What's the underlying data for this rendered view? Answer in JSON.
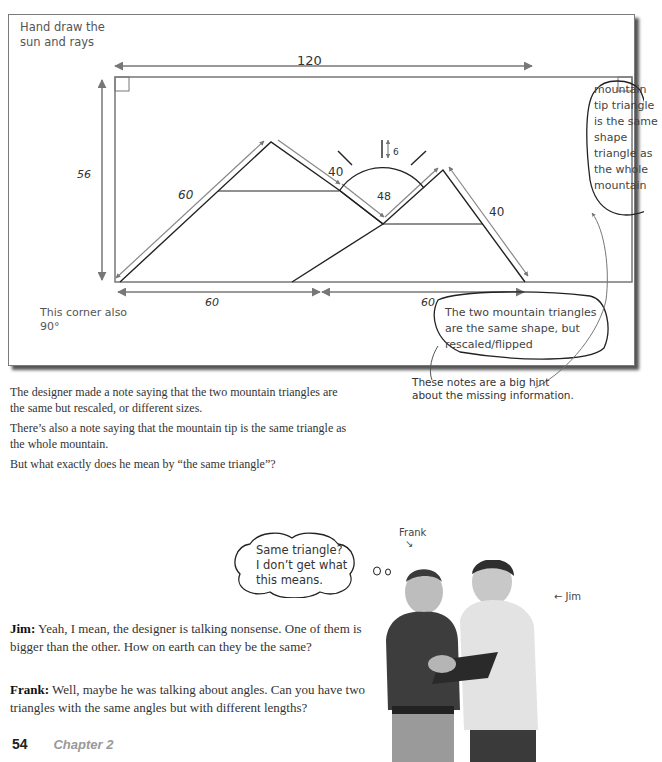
{
  "diagram": {
    "note_top_left": [
      "Hand draw the",
      "sun and rays"
    ],
    "width_label": "120",
    "height_label": "56",
    "left_slope_label": "60",
    "left_inner_slope_label": "40",
    "sun_radius_label": "48",
    "ray_length_label": "6",
    "right_slope_label": "40",
    "bottom_left_label": "60",
    "bottom_right_label": "60",
    "note_bottom_left": [
      "This corner also",
      "90°"
    ],
    "note_right": "mountain tip triangle is the same shape triangle as the whole mountain",
    "note_bottom": "The two mountain triangles are the same shape, but rescaled/flipped"
  },
  "hint": [
    "These notes are a big hint",
    "about the missing information."
  ],
  "paragraphs": [
    "The designer made a note saying that the two mountain triangles are the same but rescaled, or different sizes.",
    "There’s also a note saying that the mountain tip is the same triangle as the whole mountain.",
    "But what exactly does he mean by “the same triangle”?"
  ],
  "thought_bubble": [
    "Same triangle?",
    "I don’t get what",
    "this means."
  ],
  "labels": {
    "frank": "Frank",
    "jim": "Jim"
  },
  "dialogue": [
    {
      "speaker": "Jim:",
      "text": " Yeah, I mean, the designer is talking nonsense. One of them is bigger than the other. How on earth can they be the same?"
    },
    {
      "speaker": "Frank:",
      "text": " Well, maybe he was talking about angles. Can you have two triangles with the same angles but with different lengths?"
    }
  ],
  "footer": {
    "page": "54",
    "chapter": "Chapter 2"
  }
}
